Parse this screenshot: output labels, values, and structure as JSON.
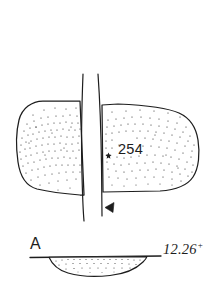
{
  "figure": {
    "kind": "archaeological-artifact-drawing",
    "background_color": "#ffffff",
    "ink_color": "#1d1d1d",
    "plan_view": {
      "description": "stippled plan view of artifact with vertical section cut gap",
      "stipple_density": "dense-center",
      "catalog_number": "254",
      "find_marker": "star-marker"
    },
    "section_cut": {
      "arrow_label": "section-arrow-left",
      "letter": "A"
    },
    "cross_section": {
      "letter": "A",
      "description": "shallow lens profile below datum line"
    },
    "scale": {
      "value": "12.26",
      "superscript": "+"
    }
  }
}
